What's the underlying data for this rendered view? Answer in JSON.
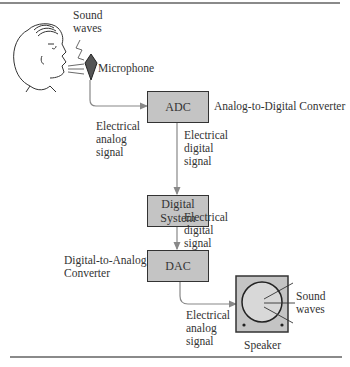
{
  "figure": {
    "nodes": [
      {
        "id": "microphone",
        "label": "Microphone"
      },
      {
        "id": "adc",
        "label": "ADC",
        "description": "Analog-to-Digital Converter"
      },
      {
        "id": "digital_system",
        "label": "Digital\nSystem"
      },
      {
        "id": "dac",
        "label": "DAC",
        "description": "Digital-to-Analog\nConverter"
      },
      {
        "id": "speaker",
        "label": "Speaker"
      }
    ],
    "edges": [
      {
        "from": "microphone",
        "to": "adc",
        "label": "Electrical\nanalog\nsignal"
      },
      {
        "from": "adc",
        "to": "digital_system",
        "label": "Electrical\ndigital\nsignal"
      },
      {
        "from": "digital_system",
        "to": "dac",
        "label": "Electrical\ndigital\nsignal"
      },
      {
        "from": "dac",
        "to": "speaker",
        "label": "Electrical\nanalog\nsignal"
      }
    ],
    "annotations": {
      "input_sound": "Sound\nwaves",
      "output_sound": "Sound\nwaves"
    },
    "colors": {
      "box_fill": "#c4c4c4",
      "speaker_cone": "#d8d8d8",
      "line": "#333333",
      "arrow": "#888888"
    }
  }
}
